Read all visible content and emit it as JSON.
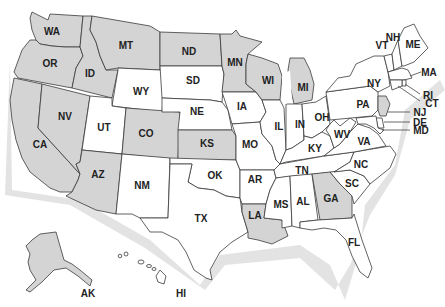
{
  "map": {
    "title": "United States",
    "colors": {
      "shaded": "#d4d4d4",
      "unshaded": "#ffffff",
      "outline": "#3a3a3a"
    },
    "states": [
      {
        "abbr": "WA",
        "shaded": true
      },
      {
        "abbr": "OR",
        "shaded": true
      },
      {
        "abbr": "CA",
        "shaded": true
      },
      {
        "abbr": "ID",
        "shaded": true
      },
      {
        "abbr": "NV",
        "shaded": true
      },
      {
        "abbr": "MT",
        "shaded": true
      },
      {
        "abbr": "WY",
        "shaded": false
      },
      {
        "abbr": "UT",
        "shaded": false
      },
      {
        "abbr": "AZ",
        "shaded": true
      },
      {
        "abbr": "CO",
        "shaded": true
      },
      {
        "abbr": "NM",
        "shaded": false
      },
      {
        "abbr": "ND",
        "shaded": true
      },
      {
        "abbr": "SD",
        "shaded": false
      },
      {
        "abbr": "NE",
        "shaded": false
      },
      {
        "abbr": "KS",
        "shaded": true
      },
      {
        "abbr": "OK",
        "shaded": false
      },
      {
        "abbr": "TX",
        "shaded": false
      },
      {
        "abbr": "MN",
        "shaded": true
      },
      {
        "abbr": "IA",
        "shaded": false
      },
      {
        "abbr": "MO",
        "shaded": false
      },
      {
        "abbr": "AR",
        "shaded": false
      },
      {
        "abbr": "LA",
        "shaded": true
      },
      {
        "abbr": "WI",
        "shaded": true
      },
      {
        "abbr": "IL",
        "shaded": false
      },
      {
        "abbr": "MI",
        "shaded": true
      },
      {
        "abbr": "IN",
        "shaded": false
      },
      {
        "abbr": "OH",
        "shaded": false
      },
      {
        "abbr": "KY",
        "shaded": false
      },
      {
        "abbr": "TN",
        "shaded": false
      },
      {
        "abbr": "MS",
        "shaded": false
      },
      {
        "abbr": "AL",
        "shaded": false
      },
      {
        "abbr": "GA",
        "shaded": true
      },
      {
        "abbr": "FL",
        "shaded": false
      },
      {
        "abbr": "SC",
        "shaded": false
      },
      {
        "abbr": "NC",
        "shaded": false
      },
      {
        "abbr": "VA",
        "shaded": false
      },
      {
        "abbr": "WV",
        "shaded": false
      },
      {
        "abbr": "PA",
        "shaded": false
      },
      {
        "abbr": "NY",
        "shaded": false
      },
      {
        "abbr": "VT",
        "shaded": false
      },
      {
        "abbr": "NH",
        "shaded": false
      },
      {
        "abbr": "ME",
        "shaded": false
      },
      {
        "abbr": "MA",
        "shaded": false
      },
      {
        "abbr": "RI",
        "shaded": false
      },
      {
        "abbr": "CT",
        "shaded": false
      },
      {
        "abbr": "NJ",
        "shaded": true
      },
      {
        "abbr": "DE",
        "shaded": false
      },
      {
        "abbr": "MD",
        "shaded": false
      },
      {
        "abbr": "AK",
        "shaded": true
      },
      {
        "abbr": "HI",
        "shaded": false
      }
    ],
    "labels": {
      "WA": "WA",
      "OR": "OR",
      "CA": "CA",
      "ID": "ID",
      "NV": "NV",
      "MT": "MT",
      "WY": "WY",
      "UT": "UT",
      "AZ": "AZ",
      "CO": "CO",
      "NM": "NM",
      "ND": "ND",
      "SD": "SD",
      "NE": "NE",
      "KS": "KS",
      "OK": "OK",
      "TX": "TX",
      "MN": "MN",
      "IA": "IA",
      "MO": "MO",
      "AR": "AR",
      "LA": "LA",
      "WI": "WI",
      "IL": "IL",
      "MI": "MI",
      "IN": "IN",
      "OH": "OH",
      "KY": "KY",
      "TN": "TN",
      "MS": "MS",
      "AL": "AL",
      "GA": "GA",
      "FL": "FL",
      "SC": "SC",
      "NC": "NC",
      "VA": "VA",
      "WV": "WV",
      "PA": "PA",
      "NY": "NY",
      "VT": "VT",
      "NH": "NH",
      "ME": "ME",
      "MA": "MA",
      "RI": "RI",
      "CT": "CT",
      "NJ": "NJ",
      "DE": "DE",
      "MD": "MD",
      "AK": "AK",
      "HI": "HI"
    }
  }
}
